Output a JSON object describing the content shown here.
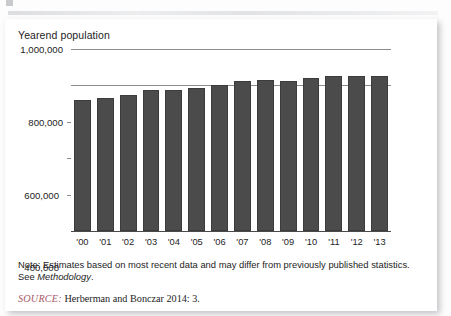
{
  "figure": {
    "chart_title": "Yearend population",
    "note_prefix": "Note: ",
    "note_text": "Estimates based on most recent data and may differ from previously published statistics. See ",
    "note_italic": "Methodology",
    "note_end": ".",
    "source_label": "SOURCE:",
    "source_text": " Herberman and Bonczar 2014: 3."
  },
  "colors": {
    "bar_fill": "#4b4b4b",
    "gridline": "#8c8c8c",
    "axis": "#4a4a4a",
    "source_label": "#a8596a",
    "text": "#1d1d1d",
    "card_background": "#ffffff"
  },
  "chart_data": {
    "type": "bar",
    "title": "Yearend population",
    "xlabel": "",
    "ylabel": "Yearend population",
    "categories": [
      "'00",
      "'01",
      "'02",
      "'03",
      "'04",
      "'05",
      "'06",
      "'07",
      "'08",
      "'09",
      "'10",
      "'11",
      "'12",
      "'13"
    ],
    "values": [
      720000,
      733000,
      750000,
      773000,
      777000,
      785000,
      800000,
      826000,
      830000,
      824000,
      840000,
      853000,
      851000,
      852000
    ],
    "ylim": [
      0,
      1000000
    ],
    "yticks": [
      0,
      200000,
      400000,
      600000,
      800000,
      1000000
    ],
    "ytick_labels": [
      "0",
      "200,000",
      "400,000",
      "600,000",
      "800,000",
      "1,000,000"
    ],
    "grid": true,
    "legend": false,
    "legend_position": "none"
  }
}
